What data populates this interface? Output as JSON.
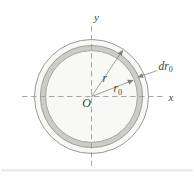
{
  "figure": {
    "labels": {
      "y_axis": "y",
      "x_axis": "x",
      "origin": "O",
      "radius": "r",
      "ring_radius_base": "r",
      "ring_radius_sub": "0",
      "ring_thickness_base": "dr",
      "ring_thickness_sub": "0"
    },
    "colors": {
      "line_gray": "#98999b",
      "dash_gray": "#9a9c9e",
      "ring_fill": "#cbcdc7",
      "disc_fill": "#f8f9f5",
      "text": "#3e3f41",
      "arrow": "#7e8082",
      "bottom_rule": "#e1e4e2",
      "background": "#ffffff"
    }
  }
}
